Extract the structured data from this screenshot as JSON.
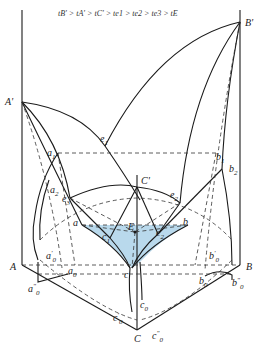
{
  "diagram": {
    "type": "ternary eutectic phase diagram (3D prism projection)",
    "title": "tB' > tA' > tC' > te1 > te2 > te3 > tE",
    "fill_color": "#b9d9ec",
    "line_color": "#1a1a1a",
    "labels": {
      "A_prime": "A'",
      "B_prime": "B'",
      "C_prime": "C'",
      "A": "A",
      "B": "B",
      "C": "C",
      "e1": "e",
      "e1_sub": "1",
      "e2": "e",
      "e2_sub": "2",
      "e3": "e",
      "e3_sub": "3",
      "a1": "a",
      "a1_sub": "1",
      "a2": "a",
      "a2_sub": "2",
      "b1": "b",
      "b1_sub": "1",
      "b2": "b",
      "b2_sub": "2",
      "a": "a",
      "b": "b",
      "c": "c",
      "c1": "c",
      "c1_sub": "1",
      "c2": "c",
      "c2_sub": "2",
      "E": "E",
      "a0": "a",
      "a0_sub": "0",
      "a0p": "a",
      "a0p_sub": "0",
      "a0p_sup": "'",
      "a0pp": "a",
      "a0pp_sub": "0",
      "a0pp_sup": "\"",
      "b0": "b",
      "b0_sub": "0",
      "b0p": "b",
      "b0p_sub": "0",
      "b0p_sup": "'",
      "b0pp": "b",
      "b0pp_sub": "0",
      "b0pp_sup": "\"",
      "c0": "c",
      "c0_sub": "0",
      "c0p": "c",
      "c0p_sub": "0",
      "c0p_sup": "'",
      "c0pp": "c",
      "c0pp_sub": "0",
      "c0pp_sup": "\""
    }
  }
}
